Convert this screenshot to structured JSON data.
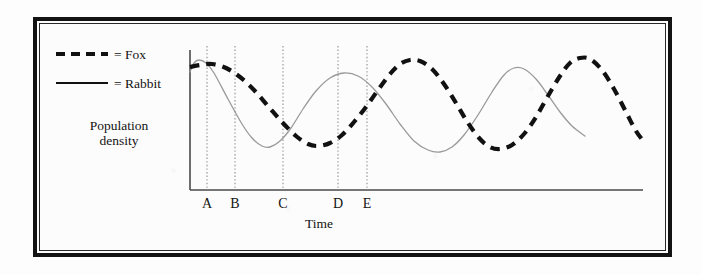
{
  "figure": {
    "kind": "scanned-textbook-figure",
    "frame_color": "#131313",
    "paper_color": "#fbfbfb"
  },
  "legend": {
    "items": [
      {
        "key": "fox",
        "label": "= Fox",
        "style": "dashed",
        "color": "#111111",
        "width": 4
      },
      {
        "key": "rabbit",
        "label": "= Rabbit",
        "style": "solid",
        "color": "#9a9a9a",
        "width": 1.3
      }
    ]
  },
  "axes": {
    "y_title_line1": "Population",
    "y_title_line2": "density",
    "x_title": "Time",
    "axis_color": "#4a4a4a"
  },
  "markers": {
    "label_color": "#131313",
    "line_color": "#8d8d8d",
    "items": [
      {
        "label": "A",
        "x": 207
      },
      {
        "label": "B",
        "x": 235
      },
      {
        "label": "C",
        "x": 283
      },
      {
        "label": "D",
        "x": 338
      },
      {
        "label": "E",
        "x": 367
      }
    ]
  },
  "chart_data": {
    "type": "line",
    "title": "",
    "xlabel": "Time",
    "ylabel": "Population density",
    "grid": false,
    "legend_position": "top-left",
    "axis_px": {
      "x_left": 190,
      "x_right": 643,
      "y_top": 50,
      "y_bottom": 190
    },
    "annotations": [
      {
        "label": "A",
        "x_px": 207,
        "type": "vertical-dotted-line"
      },
      {
        "label": "B",
        "x_px": 235,
        "type": "vertical-dotted-line"
      },
      {
        "label": "C",
        "x_px": 283,
        "type": "vertical-dotted-line"
      },
      {
        "label": "D",
        "x_px": 338,
        "type": "vertical-dotted-line"
      },
      {
        "label": "E",
        "x_px": 367,
        "type": "vertical-dotted-line"
      }
    ],
    "series": [
      {
        "name": "Rabbit",
        "style": "solid",
        "color": "#9a9a9a",
        "stroke_width": 1.3,
        "points_px": [
          [
            190,
            72
          ],
          [
            194,
            63
          ],
          [
            199,
            60
          ],
          [
            206,
            63
          ],
          [
            214,
            73
          ],
          [
            228,
            99
          ],
          [
            242,
            124
          ],
          [
            252,
            138
          ],
          [
            262,
            146
          ],
          [
            270,
            147
          ],
          [
            280,
            141
          ],
          [
            291,
            128
          ],
          [
            303,
            109
          ],
          [
            316,
            91
          ],
          [
            330,
            78
          ],
          [
            344,
            73
          ],
          [
            358,
            76
          ],
          [
            372,
            87
          ],
          [
            386,
            104
          ],
          [
            400,
            124
          ],
          [
            414,
            141
          ],
          [
            428,
            150
          ],
          [
            440,
            152
          ],
          [
            452,
            147
          ],
          [
            464,
            135
          ],
          [
            478,
            115
          ],
          [
            492,
            92
          ],
          [
            504,
            75
          ],
          [
            514,
            68
          ],
          [
            524,
            69
          ],
          [
            536,
            79
          ],
          [
            548,
            95
          ],
          [
            560,
            112
          ],
          [
            572,
            126
          ],
          [
            585,
            136
          ]
        ]
      },
      {
        "name": "Fox",
        "style": "dashed",
        "color": "#111111",
        "stroke_width": 4.2,
        "points_px": [
          [
            190,
            67
          ],
          [
            200,
            65
          ],
          [
            212,
            64
          ],
          [
            226,
            68
          ],
          [
            240,
            77
          ],
          [
            254,
            90
          ],
          [
            268,
            106
          ],
          [
            282,
            122
          ],
          [
            296,
            136
          ],
          [
            308,
            144
          ],
          [
            318,
            146
          ],
          [
            330,
            143
          ],
          [
            342,
            135
          ],
          [
            354,
            122
          ],
          [
            366,
            107
          ],
          [
            378,
            90
          ],
          [
            390,
            74
          ],
          [
            400,
            64
          ],
          [
            410,
            60
          ],
          [
            420,
            61
          ],
          [
            432,
            69
          ],
          [
            444,
            84
          ],
          [
            456,
            103
          ],
          [
            468,
            123
          ],
          [
            480,
            139
          ],
          [
            490,
            147
          ],
          [
            500,
            149
          ],
          [
            512,
            145
          ],
          [
            524,
            134
          ],
          [
            536,
            117
          ],
          [
            548,
            96
          ],
          [
            560,
            76
          ],
          [
            570,
            63
          ],
          [
            580,
            58
          ],
          [
            590,
            59
          ],
          [
            602,
            70
          ],
          [
            614,
            89
          ],
          [
            626,
            112
          ],
          [
            636,
            131
          ],
          [
            645,
            143
          ]
        ]
      }
    ]
  }
}
